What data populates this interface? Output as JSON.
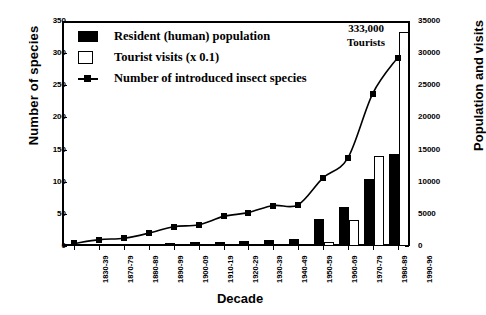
{
  "chart_data": {
    "type": "bar",
    "title": "",
    "xlabel": "Decade",
    "ylabel": "Number of species",
    "ylabel_right": "Population and visits",
    "ylim": [
      0,
      350
    ],
    "yticks": [
      0,
      50,
      100,
      150,
      200,
      250,
      300,
      350
    ],
    "ylim_right": [
      0,
      35000
    ],
    "yticks_right": [
      0,
      5000,
      10000,
      15000,
      20000,
      25000,
      30000,
      35000
    ],
    "grid": false,
    "legend_position": "top-left",
    "categories": [
      "1830-39",
      "1870-79",
      "1880-89",
      "1890-99",
      "1900-09",
      "1910-19",
      "1920-29",
      "1930-39",
      "1940-49",
      "1950-59",
      "1960-69",
      "1970-79",
      "1980-89",
      "1990-96"
    ],
    "series": [
      {
        "name": "Resident (human) population",
        "type": "bar",
        "axis": "right",
        "color": "#000000",
        "values_right_axis": [
          150,
          250,
          300,
          350,
          500,
          600,
          700,
          800,
          900,
          1100,
          4200,
          6000,
          10400,
          14300
        ],
        "values": [
          1.5,
          2.5,
          3,
          3.5,
          5,
          6,
          7,
          8,
          9,
          11,
          42,
          60,
          104,
          143
        ]
      },
      {
        "name": "Tourist visits (x 0.1)",
        "type": "bar",
        "axis": "right",
        "color": "#ffffff",
        "values_right_axis": [
          0,
          0,
          0,
          0,
          0,
          0,
          0,
          0,
          0,
          0,
          600,
          4000,
          14000,
          33300
        ],
        "values": [
          0,
          0,
          0,
          0,
          0,
          0,
          0,
          0,
          0,
          0,
          6,
          40,
          140,
          333
        ]
      },
      {
        "name": "Number of introduced insect species",
        "type": "line",
        "axis": "left",
        "color": "#000000",
        "marker": "square",
        "values": [
          4,
          10,
          12,
          20,
          30,
          33,
          46,
          52,
          63,
          64,
          106,
          137,
          237,
          293
        ]
      }
    ],
    "annotations": [
      {
        "text_line1": "333,000",
        "text_line2": "Tourists",
        "target_category": "1990-96"
      }
    ]
  },
  "legend": {
    "items": [
      {
        "label": "Resident (human) population",
        "swatch": "filled-black-square"
      },
      {
        "label": "Tourist visits (x 0.1)",
        "swatch": "open-white-square"
      },
      {
        "label": "Number of introduced insect species",
        "swatch": "line-with-square-marker"
      }
    ]
  },
  "axes": {
    "left_title": "Number of species",
    "right_title": "Population and visits",
    "bottom_title": "Decade"
  }
}
